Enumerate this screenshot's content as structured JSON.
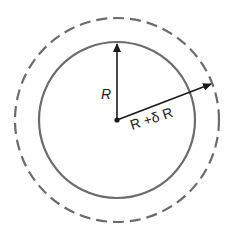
{
  "diagram": {
    "title": "",
    "center": {
      "x": 117,
      "y": 120
    },
    "inner_circle": {
      "radius": 78,
      "style": "solid",
      "color": "#6b6b6b"
    },
    "outer_circle": {
      "radius": 102,
      "style": "dashed",
      "color": "#6b6b6b"
    },
    "arrow_color": "#1a1a1a",
    "labels": {
      "inner_radius": "R",
      "outer_radius": "R +δ R"
    }
  }
}
